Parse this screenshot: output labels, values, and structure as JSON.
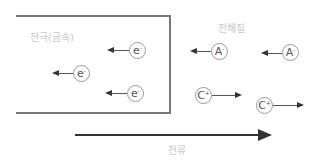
{
  "labels": {
    "electrode": "전극(금속)",
    "electrolyte": "전해질",
    "current": "전류"
  },
  "particles": {
    "e1": {
      "symbol": "e",
      "charge": "-"
    },
    "e2": {
      "symbol": "e",
      "charge": "-"
    },
    "e3": {
      "symbol": "e",
      "charge": "-"
    },
    "a1": {
      "symbol": "A",
      "charge": "-"
    },
    "a2": {
      "symbol": "A",
      "charge": "-"
    },
    "c1": {
      "symbol": "C",
      "charge": "+"
    },
    "c2": {
      "symbol": "C",
      "charge": "+"
    }
  },
  "colors": {
    "line": "#333333",
    "border": "#777777",
    "label": "#c8c8c8"
  }
}
